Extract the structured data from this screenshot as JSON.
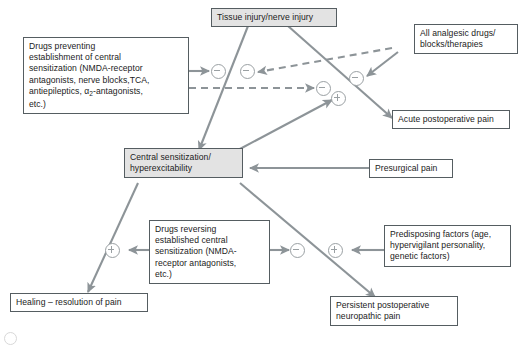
{
  "figure": {
    "type": "flowchart",
    "title": "",
    "line_color": "#8d9498",
    "box_border_color": "#555d61",
    "shaded_fill": "#e3e3e3",
    "sign_color": "#9aa0a3"
  },
  "nodes": [
    {
      "id": "tissue-injury",
      "name": "tissue-injury-node",
      "shaded": true,
      "lines": [
        "Tissue injury/nerve injury"
      ]
    },
    {
      "id": "all-analgesic",
      "name": "all-analgesic-drugs-node",
      "shaded": false,
      "lines": [
        "All analgesic drugs/",
        "blocks/therapies"
      ]
    },
    {
      "id": "drugs-preventing",
      "name": "drugs-preventing-node",
      "shaded": false,
      "lines": [
        "Drugs preventing",
        "establishment of central",
        "sensitization (NMDA-receptor",
        "antagonists, nerve blocks,TCA,",
        "antiepileptics, α2-antagonists,",
        "etc.)"
      ]
    },
    {
      "id": "acute-postop",
      "name": "acute-postoperative-pain-node",
      "shaded": false,
      "lines": [
        "Acute postoperative pain"
      ]
    },
    {
      "id": "central-sensitization",
      "name": "central-sensitization-node",
      "shaded": true,
      "lines": [
        "Central sensitization/",
        "hyperexcitability"
      ]
    },
    {
      "id": "presurgical-pain",
      "name": "presurgical-pain-node",
      "shaded": false,
      "lines": [
        "Presurgical pain"
      ]
    },
    {
      "id": "drugs-reversing",
      "name": "drugs-reversing-node",
      "shaded": false,
      "lines": [
        "Drugs reversing",
        "established central",
        "sensitization (NMDA-",
        "receptor antagonists,",
        "etc.)"
      ]
    },
    {
      "id": "predisposing-factors",
      "name": "predisposing-factors-node",
      "shaded": false,
      "lines": [
        "Predisposing factors (age,",
        "hypervigilant personality,",
        "genetic factors)"
      ]
    },
    {
      "id": "healing",
      "name": "healing-node",
      "shaded": false,
      "lines": [
        "Healing – resolution of pain"
      ]
    },
    {
      "id": "persistent-postop",
      "name": "persistent-postoperative-neuropathic-pain-node",
      "shaded": false,
      "lines": [
        "Persistent postoperative",
        "neuropathic pain"
      ]
    }
  ],
  "signs": [
    {
      "id": "sign-1",
      "name": "minus-sign-inhibit-central-sensitization",
      "symbol": "−",
      "kind": "minus"
    },
    {
      "id": "sign-2",
      "name": "minus-sign-analgesics-on-central-sensitization",
      "symbol": "−",
      "kind": "minus"
    },
    {
      "id": "sign-3",
      "name": "minus-sign-preventive-drugs-on-acute-pain",
      "symbol": "−",
      "kind": "minus"
    },
    {
      "id": "sign-4",
      "name": "minus-sign-analgesics-on-acute-pain",
      "symbol": "−",
      "kind": "minus"
    },
    {
      "id": "sign-5",
      "name": "plus-sign-central-sensitization-to-acute-pain",
      "symbol": "+",
      "kind": "plus"
    },
    {
      "id": "sign-6",
      "name": "plus-sign-reversing-drugs-to-healing",
      "symbol": "+",
      "kind": "plus"
    },
    {
      "id": "sign-7",
      "name": "minus-sign-reversing-drugs-on-persistent-pain",
      "symbol": "−",
      "kind": "minus"
    },
    {
      "id": "sign-8",
      "name": "plus-sign-predisposing-factors-on-persistent-pain",
      "symbol": "+",
      "kind": "plus"
    }
  ],
  "edges": [
    {
      "id": "e1",
      "name": "edge-tissue-injury-to-central-sensitization",
      "style": "solid",
      "arrow": true
    },
    {
      "id": "e2",
      "name": "edge-tissue-injury-to-acute-pain",
      "style": "solid",
      "arrow": true
    },
    {
      "id": "e3",
      "name": "edge-preventing-drugs-to-central-sensitization",
      "style": "solid",
      "arrow": true
    },
    {
      "id": "e4",
      "name": "edge-preventing-drugs-to-acute-pain",
      "style": "dashed",
      "arrow": true
    },
    {
      "id": "e5",
      "name": "edge-analgesics-to-central-sensitization",
      "style": "dashed",
      "arrow": true
    },
    {
      "id": "e6",
      "name": "edge-analgesics-to-acute-pain",
      "style": "solid",
      "arrow": true
    },
    {
      "id": "e7",
      "name": "edge-central-sensitization-to-acute-pain",
      "style": "solid",
      "arrow": true
    },
    {
      "id": "e8",
      "name": "edge-presurgical-pain-to-central-sensitization",
      "style": "solid",
      "arrow": true
    },
    {
      "id": "e9",
      "name": "edge-central-sensitization-to-healing",
      "style": "solid",
      "arrow": true
    },
    {
      "id": "e10",
      "name": "edge-central-sensitization-to-persistent-pain",
      "style": "solid",
      "arrow": true
    },
    {
      "id": "e11",
      "name": "edge-reversing-drugs-to-healing",
      "style": "solid",
      "arrow": true
    },
    {
      "id": "e12",
      "name": "edge-reversing-drugs-to-persistent-pain",
      "style": "solid",
      "arrow": true
    },
    {
      "id": "e13",
      "name": "edge-predisposing-factors-to-persistent-pain",
      "style": "solid",
      "arrow": true
    }
  ]
}
